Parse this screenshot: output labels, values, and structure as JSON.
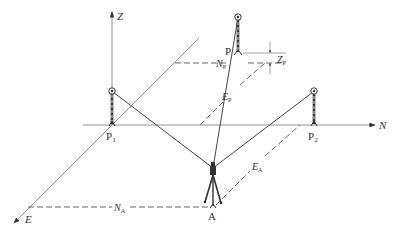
{
  "diagram": {
    "type": "survey-coordinate-geometry",
    "axes": {
      "z_label": "Z",
      "n_label": "N",
      "e_label": "E"
    },
    "points": {
      "p1": {
        "label": "P",
        "sub": "1"
      },
      "p2": {
        "label": "P",
        "sub": "2"
      },
      "p": {
        "label": "P"
      },
      "a": {
        "label": "A"
      }
    },
    "measurements": {
      "np": {
        "label": "N",
        "sub": "P"
      },
      "zp": {
        "label": "Z",
        "sub": "P"
      },
      "ep": {
        "label": "E",
        "sub": "P"
      },
      "ea": {
        "label": "E",
        "sub": "A"
      },
      "na": {
        "label": "N",
        "sub": "A"
      }
    },
    "colors": {
      "line": "#444444",
      "axis": "#777777",
      "background": "#ffffff"
    }
  }
}
